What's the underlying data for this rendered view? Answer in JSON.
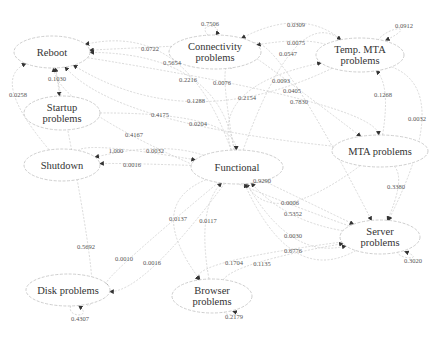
{
  "nodes": [
    {
      "id": "reboot",
      "label": "Reboot",
      "x": 52,
      "y": 52,
      "rx": 38,
      "ry": 16
    },
    {
      "id": "startup",
      "label": "Startup\nproblems",
      "x": 62,
      "y": 113,
      "rx": 38,
      "ry": 17
    },
    {
      "id": "shutdown",
      "label": "Shutdown",
      "x": 62,
      "y": 165,
      "rx": 38,
      "ry": 16
    },
    {
      "id": "connectivity",
      "label": "Connectivity\nproblems",
      "x": 215,
      "y": 52,
      "rx": 46,
      "ry": 17
    },
    {
      "id": "temp_mta",
      "label": "Temp. MTA\nproblems",
      "x": 360,
      "y": 55,
      "rx": 44,
      "ry": 17
    },
    {
      "id": "functional",
      "label": "Functional",
      "x": 237,
      "y": 167,
      "rx": 46,
      "ry": 17
    },
    {
      "id": "mta",
      "label": "MTA problems",
      "x": 380,
      "y": 151,
      "rx": 48,
      "ry": 16
    },
    {
      "id": "server",
      "label": "Server\nproblems",
      "x": 380,
      "y": 237,
      "rx": 40,
      "ry": 17
    },
    {
      "id": "disk",
      "label": "Disk problems",
      "x": 68,
      "y": 290,
      "rx": 42,
      "ry": 16
    },
    {
      "id": "browser",
      "label": "Browser\nproblems",
      "x": 212,
      "y": 296,
      "rx": 40,
      "ry": 17
    }
  ],
  "edges": [
    {
      "from": "connectivity",
      "to": "connectivity",
      "label": "0.7506",
      "lx": 210,
      "ly": 23
    },
    {
      "from": "temp_mta",
      "to": "temp_mta",
      "label": "0.0912",
      "lx": 404,
      "ly": 25
    },
    {
      "from": "server",
      "to": "server",
      "label": "0.3020",
      "lx": 413,
      "ly": 260
    },
    {
      "from": "disk",
      "to": "disk",
      "label": "0.4307",
      "lx": 80,
      "ly": 318
    },
    {
      "from": "browser",
      "to": "browser",
      "label": "0.2179",
      "lx": 234,
      "ly": 316
    },
    {
      "from": "connectivity",
      "to": "reboot",
      "label": "0.0722",
      "lx": 150,
      "ly": 48
    },
    {
      "from": "reboot",
      "to": "startup",
      "label": "0.1030",
      "lx": 57,
      "ly": 78
    },
    {
      "from": "shutdown",
      "to": "reboot",
      "label": "0.0258",
      "lx": 18,
      "ly": 94
    },
    {
      "from": "functional",
      "to": "reboot",
      "label": "0.5654",
      "lx": 172,
      "ly": 62
    },
    {
      "from": "functional",
      "to": "reboot",
      "label": "0.2216",
      "lx": 188,
      "ly": 79
    },
    {
      "from": "functional",
      "to": "connectivity",
      "label": "0.0076",
      "lx": 222,
      "ly": 82
    },
    {
      "from": "temp_mta",
      "to": "connectivity",
      "label": "0.0309",
      "lx": 296,
      "ly": 24
    },
    {
      "from": "temp_mta",
      "to": "connectivity",
      "label": "0.0075",
      "lx": 296,
      "ly": 42
    },
    {
      "from": "functional",
      "to": "temp_mta",
      "label": "0.0547",
      "lx": 288,
      "ly": 53
    },
    {
      "from": "temp_mta",
      "to": "reboot",
      "label": "0.1288",
      "lx": 196,
      "ly": 100
    },
    {
      "from": "mta",
      "to": "reboot",
      "label": "0.4175",
      "lx": 160,
      "ly": 114
    },
    {
      "from": "server",
      "to": "reboot",
      "label": "0.4167",
      "lx": 134,
      "ly": 134
    },
    {
      "from": "startup",
      "to": "functional",
      "label": "0.0204",
      "lx": 198,
      "ly": 123
    },
    {
      "from": "functional",
      "to": "temp_mta",
      "label": "0.2154",
      "lx": 247,
      "ly": 97
    },
    {
      "from": "connectivity",
      "to": "mta",
      "label": "0.0093",
      "lx": 281,
      "ly": 80
    },
    {
      "from": "connectivity",
      "to": "server",
      "label": "0.0405",
      "lx": 292,
      "ly": 90
    },
    {
      "from": "reboot",
      "to": "mta",
      "label": "0.7830",
      "lx": 299,
      "ly": 101
    },
    {
      "from": "mta",
      "to": "temp_mta",
      "label": "0.1268",
      "lx": 383,
      "ly": 94
    },
    {
      "from": "temp_mta",
      "to": "server",
      "label": "0.0032",
      "lx": 417,
      "ly": 118
    },
    {
      "from": "shutdown",
      "to": "functional",
      "label": "1.000",
      "lx": 116,
      "ly": 150
    },
    {
      "from": "functional",
      "to": "shutdown",
      "label": "0.0032",
      "lx": 155,
      "ly": 150
    },
    {
      "from": "functional",
      "to": "shutdown",
      "label": "0.0016",
      "lx": 132,
      "ly": 164
    },
    {
      "from": "mta",
      "to": "server",
      "label": "0.3380",
      "lx": 396,
      "ly": 186
    },
    {
      "from": "functional",
      "to": "server",
      "label": "0.9290",
      "lx": 262,
      "ly": 180
    },
    {
      "from": "mta",
      "to": "functional",
      "label": "0.0006",
      "lx": 290,
      "ly": 202
    },
    {
      "from": "server",
      "to": "functional",
      "label": "0.5352",
      "lx": 293,
      "ly": 213
    },
    {
      "from": "functional",
      "to": "server",
      "label": "0.0030",
      "lx": 293,
      "ly": 235
    },
    {
      "from": "server",
      "to": "functional",
      "label": "0.6776",
      "lx": 293,
      "ly": 250
    },
    {
      "from": "functional",
      "to": "browser",
      "label": "0.0137",
      "lx": 178,
      "ly": 218
    },
    {
      "from": "browser",
      "to": "functional",
      "label": "0.0117",
      "lx": 208,
      "ly": 220
    },
    {
      "from": "disk",
      "to": "reboot",
      "label": "0.5692",
      "lx": 86,
      "ly": 246
    },
    {
      "from": "functional",
      "to": "disk",
      "label": "0.0010",
      "lx": 124,
      "ly": 258
    },
    {
      "from": "functional",
      "to": "disk",
      "label": "0.0016",
      "lx": 152,
      "ly": 262
    },
    {
      "from": "server",
      "to": "browser",
      "label": "0.1704",
      "lx": 234,
      "ly": 262
    },
    {
      "from": "browser",
      "to": "server",
      "label": "0.1135",
      "lx": 262,
      "ly": 263
    }
  ],
  "style": {
    "node_stroke": "#c8c8c8",
    "edge_stroke": "#cfcfcf",
    "arrow_color": "#333333",
    "text_color": "#333333"
  }
}
